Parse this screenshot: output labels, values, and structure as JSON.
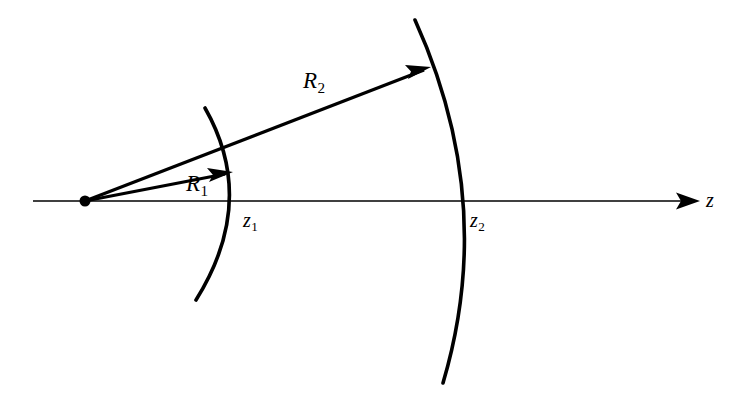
{
  "figure": {
    "background_color": "#ffffff",
    "stroke_color": "#000000",
    "width": 742,
    "height": 407
  },
  "labels": {
    "radius_1": {
      "base": "R",
      "sub": "1"
    },
    "radius_2": {
      "base": "R",
      "sub": "2"
    },
    "plane_1": {
      "base": "z",
      "sub": "1"
    },
    "plane_2": {
      "base": "z",
      "sub": "2"
    },
    "axis": {
      "base": "z",
      "sub": ""
    }
  },
  "geometry": {
    "origin": {
      "x": 85,
      "y": 201,
      "dot_radius": 5.5
    },
    "axis": {
      "name": "z-axis",
      "x_start": 33,
      "x_end": 700,
      "y": 201,
      "stroke_width": 1.6,
      "arrow_head": true
    },
    "wavefronts": [
      {
        "name": "wavefront-1",
        "label": "z1",
        "vertex_x": 240,
        "top": {
          "x": 205,
          "y": 108
        },
        "bottom": {
          "x": 196,
          "y": 300
        },
        "stroke_width": 3.6
      },
      {
        "name": "wavefront-2",
        "label": "z2",
        "vertex_x": 465,
        "top": {
          "x": 415,
          "y": 20
        },
        "bottom": {
          "x": 443,
          "y": 383
        },
        "stroke_width": 3.6
      }
    ],
    "rays": [
      {
        "name": "ray-R1",
        "from": {
          "x": 85,
          "y": 201
        },
        "to": {
          "x": 233,
          "y": 172
        },
        "stroke_width": 3.2,
        "arrow_head": true
      },
      {
        "name": "ray-R2",
        "from": {
          "x": 85,
          "y": 201
        },
        "to": {
          "x": 431,
          "y": 67
        },
        "stroke_width": 3.2,
        "arrow_head": true
      }
    ]
  }
}
